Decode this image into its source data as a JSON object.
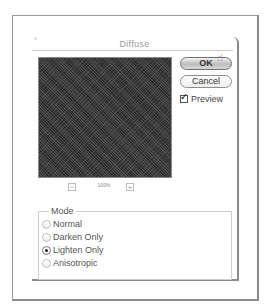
{
  "dialog": {
    "title": "Diffuse",
    "preview": {
      "zoom_level": "100%",
      "zoom_out_symbol": "–",
      "zoom_in_symbol": "+"
    },
    "buttons": {
      "ok_label": "OK",
      "cancel_label": "Cancel"
    },
    "preview_checkbox": {
      "label": "Preview",
      "checked": true
    },
    "mode": {
      "legend": "Mode",
      "options": [
        {
          "label": "Normal",
          "selected": false
        },
        {
          "label": "Darken Only",
          "selected": false
        },
        {
          "label": "Lighten Only",
          "selected": true
        },
        {
          "label": "Anisotropic",
          "selected": false
        }
      ]
    }
  }
}
